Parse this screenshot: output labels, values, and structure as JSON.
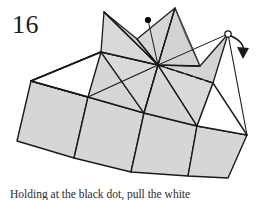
{
  "figure": {
    "number": "16",
    "caption": "Holding at the black dot, pull the white",
    "title": "Origami folding step 16"
  },
  "colors": {
    "paper_fill": "#d6d6d6",
    "paper_fill_light": "#dedede",
    "paper_fill_dark": "#cbcbcb",
    "white_face": "#ffffff",
    "stroke": "#1a1a1a",
    "stroke_thin": "#404040",
    "marker_dot": "#000000",
    "background": "#ffffff"
  },
  "markers": {
    "black_dot": {
      "label": "black dot grip point",
      "x": 148,
      "y": 20,
      "r": 3.1
    },
    "open_circle": {
      "label": "white corner point",
      "x": 228,
      "y": 34,
      "r": 3.2
    }
  },
  "arrow": {
    "label": "pull arrow",
    "path": "M 231 36 C 240 40 244 46 243 54",
    "head_points": "238,48 248,49 243,58"
  },
  "geometry": {
    "base_outline": "31,81 88,97 162,177 228,178 247,135 200,66 175,8 104,12",
    "vertices": {
      "center": {
        "x": 158,
        "y": 65
      },
      "left_corner": {
        "x": 31,
        "y": 81
      },
      "left_mid": {
        "x": 88,
        "y": 97
      },
      "peak_left": {
        "x": 104,
        "y": 12
      },
      "peak_right": {
        "x": 175,
        "y": 8
      },
      "right_corner": {
        "x": 247,
        "y": 135
      },
      "bottom_left": {
        "x": 74,
        "y": 158
      },
      "bottom_right": {
        "x": 228,
        "y": 178
      }
    }
  },
  "fold_lines": {
    "valley_dashed": {
      "label": "hidden fold line",
      "from_x": 158,
      "from_y": 65,
      "to_x": 213,
      "to_y": 83
    }
  }
}
